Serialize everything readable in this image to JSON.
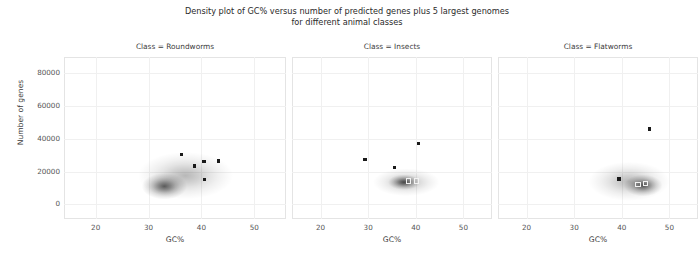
{
  "figure": {
    "title": "Density plot of GC% versus number of predicted genes plus 5 largest genomes\nfor different animal classes",
    "ylabel": "Number of genes",
    "xlabel": "GC%"
  },
  "axes": {
    "xticks": [
      "20",
      "30",
      "40",
      "50"
    ],
    "yticks": [
      "80000",
      "60000",
      "40000",
      "20000",
      "0"
    ]
  },
  "panels": [
    {
      "title": "Class = Roundworms"
    },
    {
      "title": "Class = Insects"
    },
    {
      "title": "Class = Flatworms"
    }
  ],
  "chart_data": {
    "type": "scatter",
    "title": "Density plot of GC% versus number of predicted genes plus 5 largest genomes for different animal classes",
    "xlabel": "GC%",
    "ylabel": "Number of genes",
    "xlim": [
      14,
      56
    ],
    "ylim": [
      -9000,
      90000
    ],
    "xticks": [
      20,
      30,
      40,
      50
    ],
    "yticks": [
      0,
      20000,
      40000,
      60000,
      80000
    ],
    "grid": true,
    "legend": "none",
    "facet_by": "Class",
    "overlay": "bivariate kernel density estimate (grayscale shading) with 5 largest genomes marked as points",
    "panels": [
      {
        "name": "Roundworms",
        "title": "Class = Roundworms",
        "density_peak": {
          "x": 33.0,
          "y": 11000
        },
        "density_extent": {
          "x": [
            28,
            46
          ],
          "y": [
            3000,
            32000
          ]
        },
        "points": [
          {
            "x": 36.2,
            "y": 30500,
            "marker": "dark"
          },
          {
            "x": 40.5,
            "y": 26000,
            "marker": "dark"
          },
          {
            "x": 43.2,
            "y": 26500,
            "marker": "dark"
          },
          {
            "x": 38.7,
            "y": 23500,
            "marker": "dark"
          },
          {
            "x": 40.6,
            "y": 15000,
            "marker": "dark"
          }
        ]
      },
      {
        "name": "Insects",
        "title": "Class = Insects",
        "density_peak": {
          "x": 37.5,
          "y": 13500
        },
        "density_extent": {
          "x": [
            31,
            45
          ],
          "y": [
            5000,
            22000
          ]
        },
        "points": [
          {
            "x": 40.6,
            "y": 37000,
            "marker": "dark"
          },
          {
            "x": 29.3,
            "y": 27500,
            "marker": "dark"
          },
          {
            "x": 35.5,
            "y": 22500,
            "marker": "dark"
          },
          {
            "x": 38.4,
            "y": 14500,
            "marker": "light"
          },
          {
            "x": 40.1,
            "y": 14500,
            "marker": "light"
          }
        ]
      },
      {
        "name": "Flatworms",
        "title": "Class = Flatworms",
        "density_peak": {
          "x": 44.5,
          "y": 11500
        },
        "density_extent": {
          "x": [
            33,
            50
          ],
          "y": [
            2000,
            26000
          ]
        },
        "points": [
          {
            "x": 45.8,
            "y": 46000,
            "marker": "dark"
          },
          {
            "x": 39.4,
            "y": 15500,
            "marker": "dark"
          },
          {
            "x": 43.3,
            "y": 12500,
            "marker": "light"
          },
          {
            "x": 44.9,
            "y": 13000,
            "marker": "light"
          }
        ]
      }
    ]
  }
}
